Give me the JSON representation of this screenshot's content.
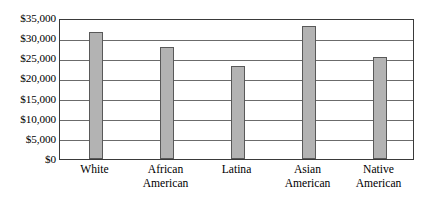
{
  "chart_data": {
    "type": "bar",
    "title": "",
    "subtitle": "",
    "xlabel": "",
    "ylabel": "",
    "categories": [
      "White",
      "African American",
      "Latina",
      "Asian American",
      "Native American"
    ],
    "category_lines": [
      [
        "White"
      ],
      [
        "African",
        "American"
      ],
      [
        "Latina"
      ],
      [
        "Asian",
        "American"
      ],
      [
        "Native",
        "American"
      ]
    ],
    "values": [
      31600,
      27800,
      23200,
      33100,
      25200
    ],
    "value_labels": [
      "$31,600",
      "$27,800",
      "$23,200",
      "$33,100",
      "$25,200"
    ],
    "ylim": [
      0,
      35000
    ],
    "ytick_step": 5000,
    "ytick_values": [
      35000,
      30000,
      25000,
      20000,
      15000,
      10000,
      5000,
      0
    ],
    "ytick_labels": [
      "$35,000",
      "$30,000",
      "$25,000",
      "$20,000",
      "$15,000",
      "$10,000",
      "$5,000",
      "$0"
    ],
    "grid": true,
    "grid_axis": "y",
    "legend": false,
    "legend_position": "none",
    "bar_fill_color": "#b3b3b3",
    "bar_border_color": "#595959",
    "gridline_color": "#6b6b6b",
    "frame_color": "#3a3a3a",
    "background_color": "#ffffff",
    "text_color": "#000000"
  }
}
